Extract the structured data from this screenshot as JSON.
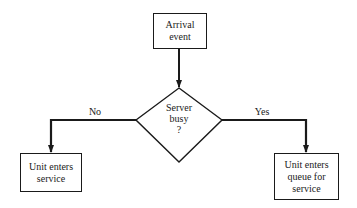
{
  "nodes": {
    "arrival": {
      "text": "Arrival event",
      "line1": "Arrival",
      "line2": "event"
    },
    "decision": {
      "line1": "Server",
      "line2": "busy",
      "line3": "?"
    },
    "no_branch": {
      "line1": "Unit enters",
      "line2": "service"
    },
    "yes_branch": {
      "line1": "Unit enters",
      "line2": "queue for",
      "line3": "service"
    }
  },
  "edges": {
    "no_label": "No",
    "yes_label": "Yes"
  },
  "colors": {
    "stroke": "#1a1a1a",
    "background": "#ffffff"
  }
}
